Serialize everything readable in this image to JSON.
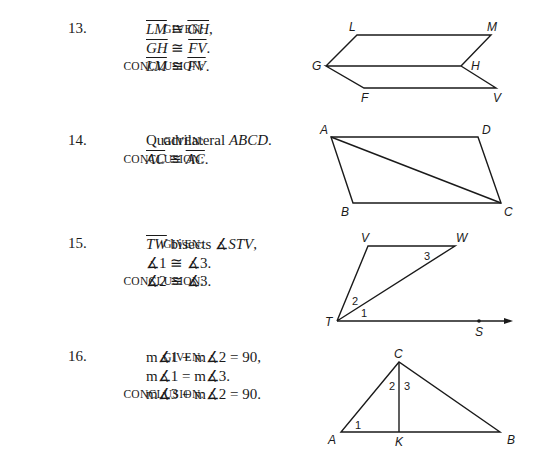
{
  "problems": [
    {
      "number": "13.",
      "given_label": "GIVEN:",
      "conclusion_label": "CONCLUSION:",
      "given": [
        {
          "parts": [
            {
              "t": "LM",
              "s": "ol"
            },
            {
              "t": " ≅ "
            },
            {
              "t": "GH",
              "s": "ol"
            },
            {
              "t": ","
            }
          ]
        },
        {
          "parts": [
            {
              "t": "GH",
              "s": "ol"
            },
            {
              "t": " ≅ "
            },
            {
              "t": "FV",
              "s": "ol"
            },
            {
              "t": "."
            }
          ]
        }
      ],
      "conclusion": {
        "parts": [
          {
            "t": "LM",
            "s": "ol"
          },
          {
            "t": " ≅ "
          },
          {
            "t": "FV",
            "s": "ol"
          },
          {
            "t": "."
          }
        ]
      },
      "figure": {
        "labels": {
          "L": "L",
          "M": "M",
          "G": "G",
          "H": "H",
          "F": "F",
          "V": "V"
        }
      }
    },
    {
      "number": "14.",
      "given_label": "GIVEN:",
      "conclusion_label": "CONCLUSION:",
      "given": [
        {
          "parts": [
            {
              "t": "Quadrilateral "
            },
            {
              "t": "ABCD",
              "s": "it"
            },
            {
              "t": "."
            }
          ]
        }
      ],
      "conclusion": {
        "parts": [
          {
            "t": "AC",
            "s": "ol"
          },
          {
            "t": " ≅ "
          },
          {
            "t": "AC",
            "s": "ol"
          },
          {
            "t": "."
          }
        ]
      },
      "figure": {
        "labels": {
          "A": "A",
          "B": "B",
          "C": "C",
          "D": "D"
        }
      }
    },
    {
      "number": "15.",
      "given_label": "GIVEN:",
      "conclusion_label": "CONCLUSION:",
      "given": [
        {
          "parts": [
            {
              "t": "TW",
              "s": "ol"
            },
            {
              "t": " bisects ∡"
            },
            {
              "t": "STV",
              "s": "it"
            },
            {
              "t": ","
            }
          ]
        },
        {
          "parts": [
            {
              "t": "∡1 ≅ ∡3."
            }
          ]
        }
      ],
      "conclusion": {
        "parts": [
          {
            "t": "∡2 ≅ ∡3."
          }
        ]
      },
      "figure": {
        "labels": {
          "V": "V",
          "W": "W",
          "T": "T",
          "S": "S",
          "a1": "1",
          "a2": "2",
          "a3": "3"
        }
      }
    },
    {
      "number": "16.",
      "given_label": "GIVEN:",
      "conclusion_label": "CONCLUSION:",
      "given": [
        {
          "parts": [
            {
              "t": "m∡1 + m∡2 = 90,"
            }
          ]
        },
        {
          "parts": [
            {
              "t": "m∡1 = m∡3."
            }
          ]
        }
      ],
      "conclusion": {
        "parts": [
          {
            "t": "m∡3 + m∡2 = 90."
          }
        ]
      },
      "figure": {
        "labels": {
          "C": "C",
          "A": "A",
          "K": "K",
          "B": "B",
          "a1": "1",
          "a2": "2",
          "a3": "3"
        }
      }
    }
  ]
}
